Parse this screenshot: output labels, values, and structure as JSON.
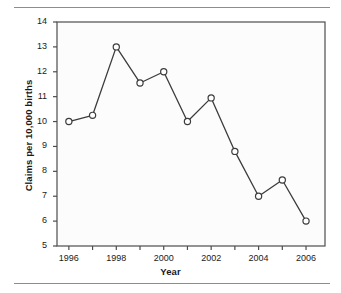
{
  "chart_data": {
    "type": "line",
    "title": "",
    "subtitle": "",
    "xlabel": "Year",
    "ylabel": "Claims per 10,000 births",
    "x": [
      1996,
      1997,
      1998,
      1999,
      2000,
      2001,
      2002,
      2003,
      2004,
      2005,
      2006
    ],
    "values": [
      10.0,
      10.25,
      13.0,
      11.55,
      12.0,
      10.0,
      10.95,
      8.8,
      7.0,
      7.65,
      6.0
    ],
    "series": [
      {
        "name": "Claims per 10,000 births",
        "values": [
          10.0,
          10.25,
          13.0,
          11.55,
          12.0,
          10.0,
          10.95,
          8.8,
          7.0,
          7.65,
          6.0
        ]
      }
    ],
    "xlim": [
      1995.5,
      2006.8
    ],
    "ylim": [
      5,
      14
    ],
    "ytick_labels": [
      "5",
      "6",
      "7",
      "8",
      "9",
      "10",
      "11",
      "12",
      "13",
      "14"
    ],
    "ytick_values": [
      5,
      6,
      7,
      8,
      9,
      10,
      11,
      12,
      13,
      14
    ],
    "xtick_labels": [
      "1996",
      "1998",
      "2000",
      "2002",
      "2004",
      "2006"
    ],
    "xtick_values": [
      1996,
      1998,
      2000,
      2002,
      2004,
      2006
    ],
    "xtick_minor_values": [
      1997,
      1999,
      2001,
      2003,
      2005
    ],
    "grid": false,
    "legend": false,
    "legend_position": "none",
    "marker": "open-circle",
    "line_color": "#3c3c3c",
    "marker_edge_color": "#3c3c3c",
    "marker_face_color": "#ffffff",
    "axis_color": "#4d4d4d",
    "plot_background": "#fcfcfc",
    "annotations": []
  },
  "figure": {
    "rule_color": "#8d8d8d"
  }
}
